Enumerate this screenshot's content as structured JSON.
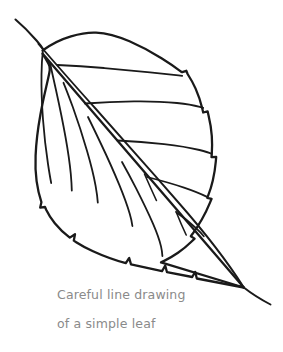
{
  "artwork": {
    "title": "Careful line drawing of a simple leaf",
    "subject": "leaf",
    "style": "line drawing",
    "background_color": "#ffffff",
    "stroke_color": "#1a1a1a",
    "canvas": {
      "width": 283,
      "height": 352
    }
  },
  "caption": {
    "line_one": "Careful line drawing",
    "line_two": "of a simple leaf",
    "color": "#8a8a8a",
    "font_size_px": 12.5
  },
  "figure": {
    "name": "simple-leaf",
    "parts": [
      {
        "name": "leaf-outline",
        "description": "serrated ovate leaf blade outline"
      },
      {
        "name": "leaf-stem",
        "description": "petiole extending up-left from leaf base"
      },
      {
        "name": "midrib",
        "description": "central vein from base to tip, exits as point at lower right"
      },
      {
        "name": "leaf-tip",
        "description": "pointed apex at lower right where midrib exits"
      },
      {
        "name": "lateral-veins-left",
        "description": "four long parallel veins on the upper-left side"
      },
      {
        "name": "lateral-veins-right",
        "description": "five curving veins fanning to the right margin"
      }
    ]
  }
}
